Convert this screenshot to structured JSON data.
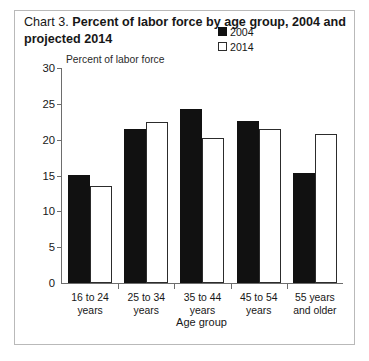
{
  "title": {
    "prefix": "Chart 3.",
    "main": "Percent of labor force by age group, 2004 and projected 2014"
  },
  "legend": {
    "position": "top-right",
    "items": [
      {
        "label": "2004",
        "swatch": "filled-black-square",
        "color": "#111111"
      },
      {
        "label": "2014",
        "swatch": "hollow-white-square",
        "color": "#ffffff"
      }
    ]
  },
  "axes": {
    "y_label": "Percent of labor force",
    "x_label": "Age group",
    "y_ticks": [
      "0",
      "5",
      "10",
      "15",
      "20",
      "25",
      "30"
    ]
  },
  "chart_data": {
    "type": "bar",
    "title": "Chart 3. Percent of labor force by age group, 2004 and projected 2014",
    "categories": [
      "16 to 24 years",
      "25 to 34 years",
      "35 to 44 years",
      "45 to 54 years",
      "55 years and older"
    ],
    "category_lines": [
      [
        "16 to 24",
        "years"
      ],
      [
        "25 to 34",
        "years"
      ],
      [
        "35 to 44",
        "years"
      ],
      [
        "45 to 54",
        "years"
      ],
      [
        "55 years",
        "and older"
      ]
    ],
    "series": [
      {
        "name": "2004",
        "values": [
          15.1,
          21.5,
          24.3,
          22.6,
          15.4
        ],
        "color": "#111111"
      },
      {
        "name": "2014",
        "values": [
          13.6,
          22.5,
          20.3,
          21.5,
          20.8
        ],
        "color": "#ffffff"
      }
    ],
    "xlabel": "Age group",
    "ylabel": "Percent of labor force",
    "ylim": [
      0,
      30
    ],
    "ytick_step": 5,
    "grid": false,
    "legend_position": "top-right"
  }
}
